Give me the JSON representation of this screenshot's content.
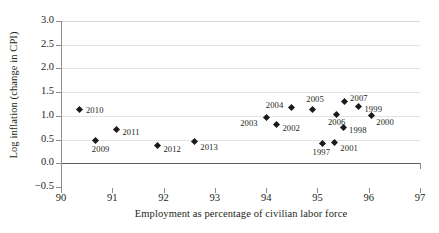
{
  "chart_data": {
    "type": "scatter",
    "title": "",
    "xlabel": "Employment as percentage of civilian labor force",
    "ylabel": "Log inflation (change in CPI)",
    "xlim": [
      90,
      97
    ],
    "ylim": [
      -0.5,
      3.0
    ],
    "xticks": [
      "90",
      "91",
      "92",
      "93",
      "94",
      "95",
      "96",
      "97"
    ],
    "yticks": [
      "3.0",
      "2.5",
      "2.0",
      "1.5",
      "1.0",
      "0.5",
      "0.0",
      "−0.5"
    ],
    "grid": "horizontal",
    "legend": "none",
    "marker": "diamond",
    "marker_color": "#1a1a1a",
    "points": [
      {
        "label": "1997",
        "x": 95.1,
        "y": 0.41,
        "label_dx": -10,
        "label_dy": 9
      },
      {
        "label": "1998",
        "x": 95.5,
        "y": 0.76,
        "label_dx": 6,
        "label_dy": 4
      },
      {
        "label": "1999",
        "x": 95.8,
        "y": 1.19,
        "label_dx": 6,
        "label_dy": 3
      },
      {
        "label": "2000",
        "x": 96.05,
        "y": 1.01,
        "label_dx": 5,
        "label_dy": 8
      },
      {
        "label": "2001",
        "x": 95.33,
        "y": 0.44,
        "label_dx": 6,
        "label_dy": 7
      },
      {
        "label": "2002",
        "x": 94.2,
        "y": 0.81,
        "label_dx": 6,
        "label_dy": 4
      },
      {
        "label": "2003",
        "x": 94.0,
        "y": 0.96,
        "label_dx": -26,
        "label_dy": 6
      },
      {
        "label": "2004",
        "x": 94.5,
        "y": 1.18,
        "label_dx": -26,
        "label_dy": -1
      },
      {
        "label": "2005",
        "x": 94.9,
        "y": 1.13,
        "label_dx": -6,
        "label_dy": -10
      },
      {
        "label": "2006",
        "x": 95.38,
        "y": 1.02,
        "label_dx": -9,
        "label_dy": 8
      },
      {
        "label": "2007",
        "x": 95.52,
        "y": 1.3,
        "label_dx": 6,
        "label_dy": -3
      },
      {
        "label": "2009",
        "x": 90.68,
        "y": 0.48,
        "label_dx": -4,
        "label_dy": 9
      },
      {
        "label": "2010",
        "x": 90.37,
        "y": 1.13,
        "label_dx": 6,
        "label_dy": 1
      },
      {
        "label": "2011",
        "x": 91.08,
        "y": 0.71,
        "label_dx": 6,
        "label_dy": 3
      },
      {
        "label": "2012",
        "x": 91.88,
        "y": 0.37,
        "label_dx": 6,
        "label_dy": 4
      },
      {
        "label": "2013",
        "x": 92.6,
        "y": 0.45,
        "label_dx": 6,
        "label_dy": 6
      }
    ]
  }
}
